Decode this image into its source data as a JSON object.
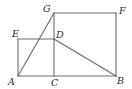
{
  "figure": {
    "type": "geometry-diagram",
    "points": {
      "A": {
        "label": "A",
        "x": 18,
        "y": 76
      },
      "C": {
        "label": "C",
        "x": 54,
        "y": 76
      },
      "B": {
        "label": "B",
        "x": 116,
        "y": 76
      },
      "E": {
        "label": "E",
        "x": 18,
        "y": 39
      },
      "D": {
        "label": "D",
        "x": 54,
        "y": 39
      },
      "G": {
        "label": "G",
        "x": 54,
        "y": 13
      },
      "F": {
        "label": "F",
        "x": 116,
        "y": 13
      }
    },
    "segments": [
      [
        "A",
        "B"
      ],
      [
        "A",
        "E"
      ],
      [
        "E",
        "D"
      ],
      [
        "C",
        "G"
      ],
      [
        "G",
        "F"
      ],
      [
        "F",
        "B"
      ],
      [
        "A",
        "G"
      ],
      [
        "D",
        "B"
      ]
    ],
    "shapes": [
      {
        "name": "square ACDE",
        "vertices": [
          "A",
          "C",
          "D",
          "E"
        ]
      },
      {
        "name": "rectangle CBFG",
        "vertices": [
          "C",
          "B",
          "F",
          "G"
        ]
      }
    ],
    "stroke_color": "#6b6b6b",
    "label_color": "#2a2a2a"
  }
}
